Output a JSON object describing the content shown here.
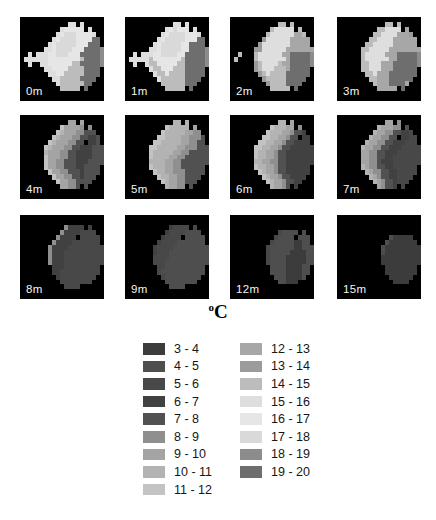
{
  "chart_data": {
    "type": "heatmap",
    "title_sup": "o",
    "title_main": "C",
    "unit": "°C",
    "encoding": {
      "background": ".",
      "keys": "0123456789ABCDEFG"
    },
    "bins": [
      {
        "key": "0",
        "range": "3 - 4",
        "color": "#3c3c3c"
      },
      {
        "key": "1",
        "range": "4 - 5",
        "color": "#4e4e4e"
      },
      {
        "key": "2",
        "range": "5 - 6",
        "color": "#484848"
      },
      {
        "key": "3",
        "range": "6 - 7",
        "color": "#414141"
      },
      {
        "key": "4",
        "range": "7 - 8",
        "color": "#515151"
      },
      {
        "key": "5",
        "range": "8 - 9",
        "color": "#8f8f8f"
      },
      {
        "key": "6",
        "range": "9 - 10",
        "color": "#a4a4a4"
      },
      {
        "key": "7",
        "range": "10 - 11",
        "color": "#b3b3b3"
      },
      {
        "key": "8",
        "range": "11 - 12",
        "color": "#c3c3c3"
      },
      {
        "key": "9",
        "range": "12 - 13",
        "color": "#a7a7a7"
      },
      {
        "key": "A",
        "range": "13 - 14",
        "color": "#9b9b9b"
      },
      {
        "key": "B",
        "range": "14 - 15",
        "color": "#bcbcbc"
      },
      {
        "key": "C",
        "range": "15 - 16",
        "color": "#dedede"
      },
      {
        "key": "D",
        "range": "16 - 17",
        "color": "#e6e6e6"
      },
      {
        "key": "E",
        "range": "17 - 18",
        "color": "#d9d9d9"
      },
      {
        "key": "F",
        "range": "18 - 19",
        "color": "#8c8c8c"
      },
      {
        "key": "G",
        "range": "19 - 20",
        "color": "#6e6e6e"
      }
    ],
    "depths_m": [
      0,
      1,
      2,
      3,
      4,
      5,
      6,
      7,
      8,
      9,
      12,
      15
    ],
    "panels": [
      {
        "label": "0m",
        "grid": [
          ".....................",
          "............CC.C.....",
          "..........CDDDDD.C...",
          ".........CDEEEDDDDC..",
          "........CDEEEEDDDDGG.",
          ".......CDEEEEEDDDGGG.",
          "......CCDEEEEDDDGGGGF",
          "..C.CCCDDEEEDDDGGGGGF",
          ".CCCCCCDDDDDDDDBGGGGF",
          "..C..CCDDDDDDBBGGGGGF",
          "......CCDDDDBBBBGGGG.",
          ".......CCDDBBBBBGGGG.",
          "........CCBBBBBGGGG..",
          ".........CBBBBBBGG...",
          "..........BBBBB.G....",
          ".....................",
          "....................."
        ]
      },
      {
        "label": "1m",
        "grid": [
          ".....................",
          "............CC.C.....",
          "..........CDEDDD.C...",
          ".........CDEEEEDDDC..",
          "........CDEEEEEDDDGG.",
          ".......CDEEEEEDDGGGG.",
          "......CCDEEEEEDDGGGGF",
          "..C.CCCDDEEEEDDGGGGGF",
          ".CCCCCBDDDDDDDBGGGGGF",
          "..C..CBBDDDDDBBGGGGGF",
          "......CBBDDDBBBGGGGG.",
          ".......CBBDBBBBGGGGG.",
          "........CBBBBBBGGGG..",
          ".........BBBBBBGGG...",
          "..........BBBBB.G....",
          ".....................",
          "....................."
        ]
      },
      {
        "label": "2m",
        "grid": [
          ".....................",
          "............BB.B.....",
          "..........BCCCCC.B...",
          ".........BCCCCCC99B..",
          "........ACCCCCC99999.",
          ".......ACCCCCCC99999.",
          "......AACCCCCC9999999",
          "..B...BCCCCCC99GGGGGF",
          ".B....BCCCCCCC9GGGGGF",
          "......ABCCCCB99GGGGGF",
          "......ABCCCBBB9GGGGG.",
          ".......ABCBBBBGGGGGG.",
          "........ABBBBBGGGGG..",
          ".........ABBBBGGGG...",
          "..........BBBBB.G....",
          ".....................",
          "....................."
        ]
      },
      {
        "label": "3m",
        "grid": [
          ".....................",
          "............BB.B.....",
          "..........BBCCCC.9...",
          ".........BBCCCC999A..",
          "........BBCCCC999999.",
          ".......BBCCCCC999999.",
          "......BBCCCCC99999999",
          "......BCCCCC999GGGGGF",
          "......BCCCCCC99GGGGGF",
          "......BBCCC999GGGGGGF",
          "......BBCCC999GGGGGG.",
          ".......BBC999GGGGGGG.",
          "........BB999GGGGGG..",
          ".........B999GGGG9...",
          "..........99999.G....",
          ".....................",
          "....................."
        ]
      },
      {
        "label": "4m",
        "grid": [
          ".....................",
          "............66.6.....",
          "..........866665.5...",
          ".........8766655444..",
          "........876665544334.",
          ".......876665544.334.",
          "......876665544333444",
          "......766655443333444",
          "......866655443333444",
          "......866554443334444",
          "......86655444334444.",
          ".......8665544434444.",
          "........86655443444..",
          ".........866554444...",
          "..........66554.4....",
          ".....................",
          "....................."
        ]
      },
      {
        "label": "5m",
        "grid": [
          ".....................",
          "............77.7.....",
          "..........877777.6...",
          ".........8777776655..",
          "........887777665554.",
          ".......8877777665544.",
          "......887777766555444",
          "......877777665544444",
          "......877776655444444",
          "......777766554444444",
          "......87776655444444.",
          ".......8776655544444.",
          "........87766554444..",
          ".........876655444...",
          "..........76655.4....",
          ".....................",
          "....................."
        ]
      },
      {
        "label": "6m",
        "grid": [
          ".....................",
          "............77.6.....",
          "..........877766.5...",
          ".........8777665443..",
          "........887766544.33.",
          ".......8877665443333.",
          "......887766544333333",
          "......877665443333333",
          "......877665443333333",
          "......776655443333333",
          "......87766544333333.",
          ".......8766544333333.",
          "........87665443333..",
          ".........876654433...",
          "..........76654.3....",
          ".....................",
          "....................."
        ]
      },
      {
        "label": "7m",
        "grid": [
          ".....................",
          "............66.5.....",
          "..........766655.4...",
          ".........7665544332..",
          "........7665544.3322.",
          ".......7665544333222.",
          "......766554433322222",
          "......665544333222222",
          "......665544332222222",
          "......665543332222222",
          "......76554433222222.",
          ".......7655443322222.",
          "........76544332222..",
          ".........765443222...",
          "..........65443.2....",
          ".....................",
          "....................."
        ]
      },
      {
        "label": "8m",
        "grid": [
          ".....................",
          ".....................",
          "...........53333.3...",
          "..........533332222..",
          ".........53333.22222.",
          "........533332222222.",
          ".......53333222222222",
          ".......53332222222222",
          ".......53332222222222",
          ".......53332222222222",
          "........333222222222.",
          "........332222222222.",
          ".........3222222222..",
          "..........22222222...",
          "...........2222......",
          ".....................",
          "....................."
        ]
      },
      {
        "label": "9m",
        "grid": [
          ".....................",
          ".....................",
          "...........32222.2...",
          "..........322221111..",
          ".........32222.11111.",
          "........322221111111.",
          ".......32222111111111",
          ".......32221111111111",
          ".......22221111111111",
          ".......22211111111111",
          "........221111111111.",
          "........211111111111.",
          ".........2111111111..",
          "..........11111111...",
          "...........1111......",
          ".....................",
          "....................."
        ]
      },
      {
        "label": "12m",
        "grid": [
          ".....................",
          ".....................",
          ".....................",
          "............21111.1..",
          "...........21111.111.",
          "..........2111110011.",
          ".........211111100111",
          ".........211111000011",
          ".........211110000011",
          ".........211110000011",
          "..........1111000011.",
          "..........1111000011.",
          "...........11100001..",
          "............11000....",
          ".....................",
          ".....................",
          "....................."
        ]
      },
      {
        "label": "15m",
        "grid": [
          ".....................",
          ".....................",
          ".....................",
          ".....................",
          ".............100000..",
          "............10000000.",
          "...........1000000000",
          "...........1000000000",
          "...........0000000000",
          "...........0000000000",
          "............00000000.",
          "............00000000.",
          ".............000000..",
          "..............0000...",
          ".....................",
          ".....................",
          "....................."
        ]
      }
    ]
  }
}
